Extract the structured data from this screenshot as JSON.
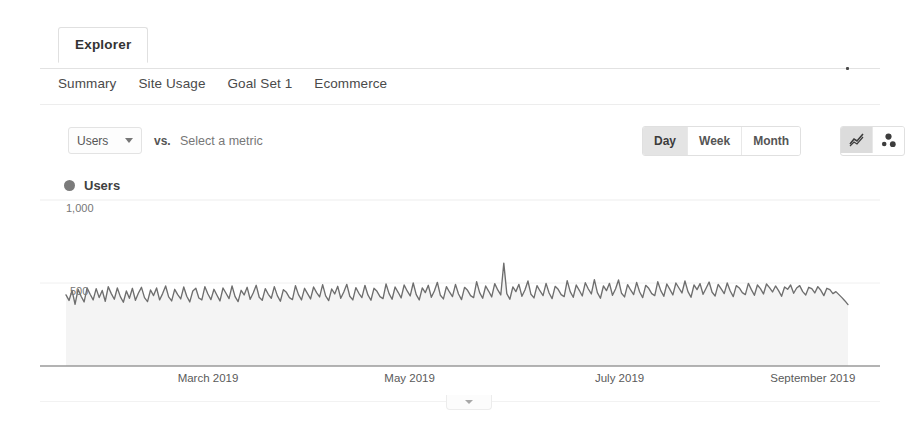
{
  "tab": {
    "label": "Explorer"
  },
  "subnav": {
    "items": [
      {
        "label": "Summary"
      },
      {
        "label": "Site Usage"
      },
      {
        "label": "Goal Set 1"
      },
      {
        "label": "Ecommerce"
      }
    ]
  },
  "controls": {
    "metric_selected": "Users",
    "vs_label": "vs.",
    "secondary_metric_placeholder": "Select a metric",
    "granularity": {
      "options": [
        "Day",
        "Week",
        "Month"
      ],
      "selected": "Day"
    },
    "chart_types": [
      {
        "name": "line-chart",
        "selected": true
      },
      {
        "name": "motion-chart",
        "selected": false
      }
    ]
  },
  "legend": {
    "series_label": "Users",
    "color": "#7b7b7b"
  },
  "chart_data": {
    "type": "line",
    "title": "Users",
    "xlabel": "",
    "ylabel": "Users",
    "ylim": [
      0,
      1000
    ],
    "yticks": [
      500,
      1000
    ],
    "ytick_labels": [
      "500",
      "1,000"
    ],
    "grid": true,
    "legend_position": "top-left",
    "area_fill": "#f4f4f4",
    "line_color": "#6e6e6e",
    "xtick_labels": [
      "March 2019",
      "May 2019",
      "July 2019",
      "September 2019"
    ],
    "xtick_positions": [
      0.2,
      0.44,
      0.69,
      0.92
    ],
    "series": [
      {
        "name": "Users",
        "values": [
          428,
          395,
          455,
          372,
          462,
          420,
          386,
          470,
          432,
          398,
          466,
          412,
          455,
          390,
          478,
          436,
          402,
          470,
          418,
          384,
          452,
          408,
          468,
          396,
          440,
          474,
          412,
          388,
          458,
          424,
          470,
          398,
          436,
          482,
          416,
          392,
          462,
          430,
          404,
          476,
          420,
          386,
          452,
          468,
          410,
          398,
          478,
          434,
          400,
          462,
          426,
          392,
          470,
          438,
          406,
          482,
          418,
          388,
          456,
          428,
          474,
          402,
          440,
          486,
          414,
          396,
          466,
          432,
          408,
          478,
          424,
          390,
          460,
          444,
          412,
          400,
          484,
          430,
          398,
          468,
          436,
          404,
          476,
          442,
          416,
          490,
          422,
          394,
          464,
          434,
          480,
          408,
          446,
          492,
          420,
          398,
          472,
          438,
          412,
          486,
          428,
          396,
          468,
          450,
          418,
          406,
          494,
          436,
          402,
          476,
          444,
          410,
          488,
          452,
          422,
          500,
          430,
          398,
          470,
          442,
          486,
          414,
          452,
          504,
          426,
          404,
          478,
          446,
          418,
          492,
          434,
          400,
          474,
          456,
          424,
          412,
          508,
          442,
          408,
          482,
          450,
          416,
          496,
          458,
          428,
          620,
          436,
          402,
          476,
          448,
          492,
          420,
          458,
          512,
          432,
          410,
          484,
          452,
          424,
          498,
          440,
          406,
          480,
          462,
          430,
          418,
          514,
          448,
          414,
          488,
          456,
          422,
          502,
          464,
          434,
          520,
          442,
          408,
          482,
          454,
          498,
          426,
          464,
          518,
          438,
          416,
          490,
          458,
          430,
          504,
          446,
          412,
          486,
          468,
          436,
          424,
          508,
          454,
          420,
          494,
          462,
          428,
          500,
          470,
          440,
          512,
          448,
          414,
          488,
          460,
          496,
          432,
          468,
          506,
          444,
          422,
          492,
          464,
          436,
          500,
          452,
          418,
          484,
          470,
          442,
          430,
          498,
          460,
          426,
          488,
          466,
          434,
          494,
          472,
          446,
          482,
          454,
          420,
          476,
          462,
          488,
          438,
          470,
          484,
          448,
          428,
          474,
          466,
          440,
          478,
          456,
          424,
          468,
          460,
          436,
          448,
          430,
          412,
          392,
          370
        ]
      }
    ]
  },
  "collapse_handle": {
    "name": "collapse-panel-handle"
  }
}
